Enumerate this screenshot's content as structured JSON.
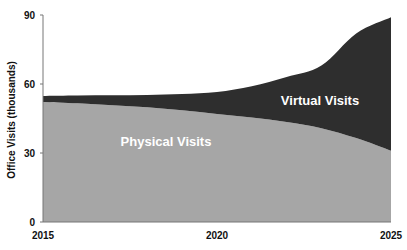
{
  "chart_data": {
    "type": "area",
    "stacked": true,
    "title": "",
    "xlabel": "",
    "ylabel": "Office Visits (thousands)",
    "x": [
      2015,
      2016,
      2017,
      2018,
      2019,
      2020,
      2021,
      2022,
      2023,
      2024,
      2025
    ],
    "x_ticks": [
      "2015",
      "2020",
      "2025"
    ],
    "y_ticks": [
      "0",
      "30",
      "60",
      "90"
    ],
    "ylim": [
      0,
      90
    ],
    "xlim": [
      2015,
      2025
    ],
    "grid": false,
    "legend": "none (inline labels)",
    "series": [
      {
        "name": "Physical Visits",
        "color": "#a6a6a6",
        "values": [
          52.2,
          51.6,
          50.8,
          49.9,
          48.6,
          47.0,
          45.4,
          43.5,
          40.8,
          36.5,
          31.0
        ]
      },
      {
        "name": "Virtual Visits",
        "color": "#2e2e2e",
        "values": [
          2.6,
          3.4,
          4.3,
          5.3,
          7.0,
          9.5,
          13.6,
          19.5,
          27.2,
          45.5,
          58.0
        ]
      }
    ],
    "totals": [
      54.8,
      55.0,
      55.1,
      55.2,
      55.6,
      56.5,
      59.0,
      63.0,
      68.0,
      82.0,
      89.0
    ],
    "annotations": [
      "Physical Visits",
      "Virtual Visits"
    ]
  }
}
